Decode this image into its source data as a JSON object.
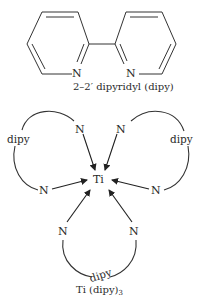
{
  "figure": {
    "structure": {
      "left_ring_atom": "N",
      "right_ring_atom": "N",
      "caption": "2–2′ dipyridyl (dipy)"
    },
    "complex": {
      "center_atom": "Ti",
      "donor_atom": "N",
      "ligands": [
        {
          "label": "dipy",
          "position": "upper-left"
        },
        {
          "label": "dipy",
          "position": "upper-right"
        },
        {
          "label": "dipy",
          "position": "bottom"
        }
      ],
      "title": "Ti (dipy)",
      "title_subscript": "3"
    },
    "colors": {
      "ink": "#2a2a2a",
      "background": "#ffffff"
    }
  }
}
